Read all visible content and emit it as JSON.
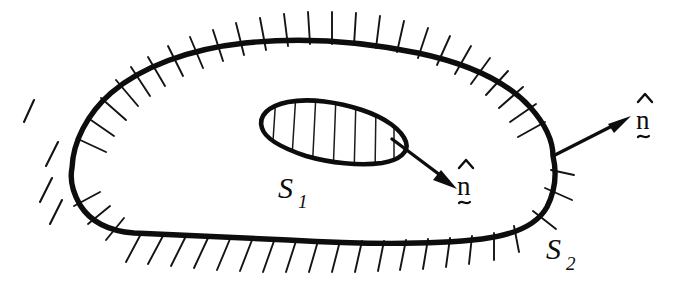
{
  "figure": {
    "background_color": "#ffffff",
    "ink_color": "#0d0d0d",
    "width": 699,
    "height": 290
  },
  "labels": {
    "inner_surface": {
      "base": "S",
      "subscript": "1",
      "full": "S1",
      "x": 280,
      "y": 196
    },
    "outer_surface": {
      "base": "S",
      "subscript": "2",
      "full": "S2",
      "x": 548,
      "y": 258
    },
    "normal_inner": {
      "base": "n",
      "accent": "circumflex",
      "under_accent": "tilde",
      "full": "n-hat",
      "x": 463,
      "y": 196
    },
    "normal_outer": {
      "base": "n",
      "accent": "circumflex",
      "under_accent": "tilde",
      "full": "n-hat",
      "x": 642,
      "y": 130
    }
  },
  "arrows": {
    "inner_normal": {
      "name": "inner-normal-arrow",
      "from_x": 392,
      "from_y": 139,
      "to_x": 456,
      "to_y": 187,
      "direction": "down-right"
    },
    "outer_normal": {
      "name": "outer-normal-arrow",
      "from_x": 553,
      "from_y": 156,
      "to_x": 629,
      "to_y": 117,
      "direction": "up-right"
    }
  },
  "shapes": {
    "outer_boundary": {
      "name": "outer-boundary-curve",
      "path": "M 72 168 C 74 140 88 112 112 92 C 142 66 190 48 246 42 C 302 36 360 40 418 52 C 470 63 508 82 530 106 C 546 124 552 140 552 156 C 556 172 554 190 546 206 C 536 224 514 234 482 238 C 430 244 356 243 288 239 C 226 236 168 234 134 232 C 108 230 90 220 80 204 C 72 190 70 178 72 168 Z",
      "hatch_side": "outward",
      "hatch_count": 40
    },
    "inner_boundary": {
      "name": "inner-surface-curve",
      "path": "M 262 128 C 258 116 268 106 288 102 C 310 98 338 102 362 110 C 386 118 402 130 406 142 C 409 152 400 160 382 163 C 360 166 330 163 306 156 C 282 148 265 139 262 128 Z",
      "hatch_count": 7,
      "hatch_direction": "near-vertical"
    }
  },
  "hatching": {
    "outer_marks_note": "short strokes radiating outward from the outer boundary",
    "inner_marks_note": "near-vertical fill strokes inside the inner closed curve",
    "detached_marks_note": "a few isolated strokes at the far left outside the boundary"
  }
}
